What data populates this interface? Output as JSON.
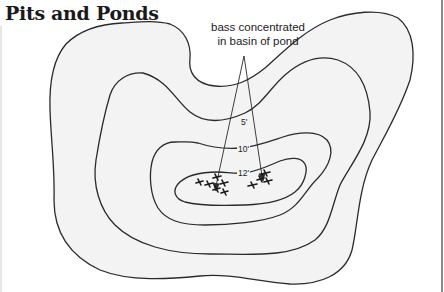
{
  "title": "Pits and Ponds",
  "annotation": {
    "line1": "bass concentrated",
    "line2": "in basin of pond"
  },
  "contours": [
    {
      "depth": "5'",
      "label": "5'"
    },
    {
      "depth": "10'",
      "label": "10'"
    },
    {
      "depth": "12'",
      "label": "12'"
    }
  ],
  "colors": {
    "land_fill": "#f3f3f3",
    "contour_line": "#2a2a2a",
    "background": "#ffffff",
    "border": "#8a8a8a"
  },
  "icons": {
    "fish": "fish-icon",
    "arrow": "arrow-icon"
  }
}
